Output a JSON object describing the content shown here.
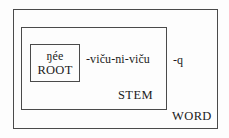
{
  "diagram": {
    "type": "nested-morphology-box-diagram",
    "root": {
      "form": "ŋée",
      "label": "ROOT"
    },
    "stem": {
      "affix": "-viču-ni-viču",
      "label": "STEM"
    },
    "word": {
      "affix": "-q",
      "label": "WORD"
    }
  },
  "colors": {
    "border": "#4a4a4a",
    "text": "#1b1b1b",
    "background": "#fdfdfd"
  }
}
